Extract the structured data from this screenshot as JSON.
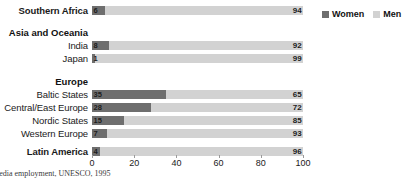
{
  "chart_data": {
    "type": "bar",
    "orientation": "horizontal",
    "stacked": true,
    "title": "",
    "xlabel": "",
    "ylabel": "",
    "xlim": [
      0,
      100
    ],
    "xticks": [
      0,
      20,
      40,
      60,
      80,
      100
    ],
    "grid": false,
    "legend_position": "top-right",
    "series": [
      {
        "name": "Women",
        "color": "#6e6e6e"
      },
      {
        "name": "Men",
        "color": "#d2d2d2"
      }
    ],
    "categories": [
      "Southern Africa",
      "India",
      "Japan",
      "Baltic States",
      "Central/East Europe",
      "Nordic States",
      "Western Europe",
      "Latin America"
    ],
    "women_values": [
      6,
      8,
      1,
      35,
      28,
      15,
      7,
      4
    ],
    "men_values": [
      94,
      92,
      99,
      65,
      72,
      85,
      93,
      96
    ],
    "group_headings": [
      "Asia and Oceania",
      "Europe"
    ]
  },
  "rows": [
    {
      "label": "Southern Africa",
      "bold": true,
      "women": 6,
      "men": 94,
      "top": 5,
      "type": "bar"
    },
    {
      "label": "Asia and Oceania",
      "bold": true,
      "top": 27,
      "type": "heading"
    },
    {
      "label": "India",
      "bold": false,
      "women": 8,
      "men": 92,
      "top": 40,
      "type": "bar"
    },
    {
      "label": "Japan",
      "bold": false,
      "women": 1,
      "men": 99,
      "top": 53,
      "type": "bar"
    },
    {
      "label": "Europe",
      "bold": true,
      "top": 76,
      "type": "heading"
    },
    {
      "label": "Baltic States",
      "bold": false,
      "women": 35,
      "men": 65,
      "top": 89,
      "type": "bar"
    },
    {
      "label": "Central/East Europe",
      "bold": false,
      "women": 28,
      "men": 72,
      "top": 102,
      "type": "bar"
    },
    {
      "label": "Nordic States",
      "bold": false,
      "women": 15,
      "men": 85,
      "top": 115,
      "type": "bar"
    },
    {
      "label": "Western Europe",
      "bold": false,
      "women": 7,
      "men": 93,
      "top": 128,
      "type": "bar"
    },
    {
      "label": "Latin America",
      "bold": true,
      "women": 4,
      "men": 96,
      "top": 146,
      "type": "bar"
    }
  ],
  "axis": {
    "ticks": [
      {
        "label": "0",
        "value": 0
      },
      {
        "label": "20",
        "value": 20
      },
      {
        "label": "40",
        "value": 40
      },
      {
        "label": "60",
        "value": 60
      },
      {
        "label": "80",
        "value": 80
      },
      {
        "label": "100",
        "value": 100
      }
    ]
  },
  "legend": {
    "items": [
      {
        "label": "Women",
        "key": "women"
      },
      {
        "label": "Men",
        "key": "men"
      }
    ]
  },
  "footnote": {
    "text": "media employment, UNESCO, 1995"
  },
  "colors": {
    "women": "#6e6e6e",
    "men": "#d2d2d2",
    "text": "#1a1a1a",
    "background": "#ffffff"
  }
}
